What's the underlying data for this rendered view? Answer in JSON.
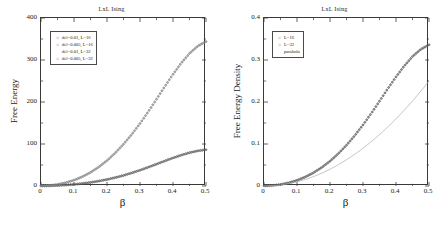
{
  "figure": {
    "panels": [
      {
        "id": "left",
        "title": "LxL Ising",
        "xlabel": "β",
        "ylabel": "Free Energy",
        "x_ticks": [
          "0",
          "0.1",
          "0.2",
          "0.3",
          "0.4",
          "0.5"
        ],
        "y_ticks": [
          "0",
          "100",
          "200",
          "300",
          "400"
        ],
        "legend": [
          {
            "marker": "○",
            "label": "del=0.01, L=16"
          },
          {
            "marker": "○",
            "label": "del=0.005, L=16"
          },
          {
            "marker": "",
            "label": "del=0.01, L=32"
          },
          {
            "marker": "○",
            "label": "del=0.005, L=32"
          }
        ]
      },
      {
        "id": "right",
        "title": "LxL Ising",
        "xlabel": "β",
        "ylabel": "Free Energy Density",
        "x_ticks": [
          "0",
          "0.1",
          "0.2",
          "0.3",
          "0.4",
          "0.5"
        ],
        "y_ticks": [
          "0",
          "0.1",
          "0.2",
          "0.3",
          "0.4"
        ],
        "legend": [
          {
            "marker": "○",
            "label": "L=16"
          },
          {
            "marker": "○",
            "label": "L=32"
          },
          {
            "marker": "",
            "label": "parabola"
          }
        ]
      }
    ]
  },
  "chart_data": [
    {
      "type": "scatter",
      "title": "LxL Ising",
      "xlabel": "β",
      "ylabel": "Free Energy",
      "xlim": [
        0,
        0.5
      ],
      "ylim": [
        0,
        400
      ],
      "grid": false,
      "legend_position": "upper-left",
      "x": [
        0.0,
        0.025,
        0.05,
        0.075,
        0.1,
        0.125,
        0.15,
        0.175,
        0.2,
        0.225,
        0.25,
        0.275,
        0.3,
        0.325,
        0.35,
        0.375,
        0.4,
        0.425,
        0.45,
        0.475,
        0.5
      ],
      "series": [
        {
          "name": "del=0.01, L=16",
          "marker": "open-circle",
          "color": "#555555",
          "values": [
            0.0,
            0.2,
            0.8,
            1.9,
            3.4,
            5.5,
            8.1,
            11.3,
            15.1,
            19.6,
            24.8,
            30.7,
            37.2,
            44.3,
            51.7,
            59.2,
            66.4,
            73.1,
            78.9,
            83.3,
            86.0
          ]
        },
        {
          "name": "del=0.005, L=16",
          "marker": "open-circle",
          "color": "#666666",
          "values": [
            0.0,
            0.2,
            0.8,
            1.9,
            3.4,
            5.5,
            8.1,
            11.3,
            15.1,
            19.6,
            24.8,
            30.7,
            37.2,
            44.3,
            51.7,
            59.2,
            66.4,
            73.1,
            78.9,
            83.3,
            86.0
          ]
        },
        {
          "name": "del=0.01, L=32",
          "marker": "open-circle",
          "color": "#777777",
          "values": [
            0.0,
            0.8,
            3.3,
            7.5,
            13.5,
            21.6,
            32.0,
            44.8,
            60.2,
            78.3,
            99.1,
            122.5,
            148.4,
            176.5,
            206.2,
            236.4,
            265.6,
            292.3,
            315.2,
            332.8,
            343.5
          ]
        },
        {
          "name": "del=0.005, L=32",
          "marker": "open-circle",
          "color": "#888888",
          "values": [
            0.0,
            0.8,
            3.3,
            7.5,
            13.5,
            21.6,
            32.0,
            44.8,
            60.2,
            78.3,
            99.1,
            122.5,
            148.4,
            176.5,
            206.2,
            236.4,
            265.6,
            292.3,
            315.2,
            332.8,
            343.5
          ]
        }
      ]
    },
    {
      "type": "scatter",
      "title": "LxL Ising",
      "xlabel": "β",
      "ylabel": "Free Energy Density",
      "xlim": [
        0,
        0.5
      ],
      "ylim": [
        0,
        0.4
      ],
      "grid": false,
      "legend_position": "upper-left",
      "x": [
        0.0,
        0.025,
        0.05,
        0.075,
        0.1,
        0.125,
        0.15,
        0.175,
        0.2,
        0.225,
        0.25,
        0.275,
        0.3,
        0.325,
        0.35,
        0.375,
        0.4,
        0.425,
        0.45,
        0.475,
        0.5
      ],
      "series": [
        {
          "name": "L=16",
          "marker": "open-circle",
          "color": "#444444",
          "values": [
            0.0,
            0.0008,
            0.0031,
            0.0073,
            0.0132,
            0.0211,
            0.0313,
            0.0438,
            0.0588,
            0.0765,
            0.0968,
            0.1198,
            0.1452,
            0.1727,
            0.2017,
            0.2313,
            0.2594,
            0.2855,
            0.308,
            0.3251,
            0.336
          ]
        },
        {
          "name": "L=32",
          "marker": "open-circle",
          "color": "#666666",
          "values": [
            0.0,
            0.0008,
            0.0032,
            0.0073,
            0.0132,
            0.0211,
            0.0313,
            0.0438,
            0.0588,
            0.0765,
            0.0968,
            0.1197,
            0.145,
            0.1724,
            0.2014,
            0.2309,
            0.2594,
            0.2855,
            0.3079,
            0.325,
            0.3355
          ]
        },
        {
          "name": "parabola",
          "marker": "line",
          "color": "#aaaaaa",
          "values": [
            0.0,
            0.0006,
            0.0025,
            0.0056,
            0.01,
            0.0156,
            0.0225,
            0.0306,
            0.04,
            0.0506,
            0.0625,
            0.0756,
            0.09,
            0.1056,
            0.1225,
            0.1406,
            0.16,
            0.1806,
            0.2025,
            0.2256,
            0.25
          ]
        }
      ]
    }
  ]
}
